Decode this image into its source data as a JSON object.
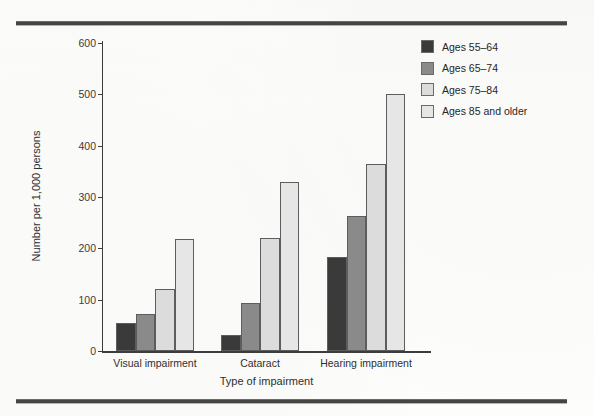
{
  "figure": {
    "background_color": "#fdfdfc",
    "rule_color": "#454545",
    "top_rule": "horizontal-rule-top",
    "bottom_rule": "horizontal-rule-bottom"
  },
  "chart_data": {
    "type": "bar",
    "title": "",
    "xlabel": "Type of impairment",
    "ylabel": "Number per 1,000 persons",
    "categories": [
      "Visual impairment",
      "Cataract",
      "Hearing impairment"
    ],
    "yticks": [
      0,
      100,
      200,
      300,
      400,
      500,
      600
    ],
    "ylim": [
      0,
      600
    ],
    "grid": false,
    "legend_position": "top-right",
    "series": [
      {
        "name": "Ages 55–64",
        "color": "#3a3a3a",
        "values": [
          55,
          32,
          184
        ]
      },
      {
        "name": "Ages 65–74",
        "color": "#8a8a8a",
        "values": [
          72,
          93,
          263
        ]
      },
      {
        "name": "Ages 75–84",
        "color": "#dcdcdc",
        "values": [
          120,
          221,
          364
        ]
      },
      {
        "name": "Ages 85 and older",
        "color": "#e6e6e6",
        "values": [
          218,
          330,
          500
        ]
      }
    ]
  },
  "legend": {
    "items": [
      {
        "label": "Ages 55–64",
        "swatch_color": "#3a3a3a"
      },
      {
        "label": "Ages 65–74",
        "swatch_color": "#8a8a8a"
      },
      {
        "label": "Ages 75–84",
        "swatch_color": "#dcdcdc"
      },
      {
        "label": "Ages 85 and older",
        "swatch_color": "#e6e6e6"
      }
    ]
  }
}
